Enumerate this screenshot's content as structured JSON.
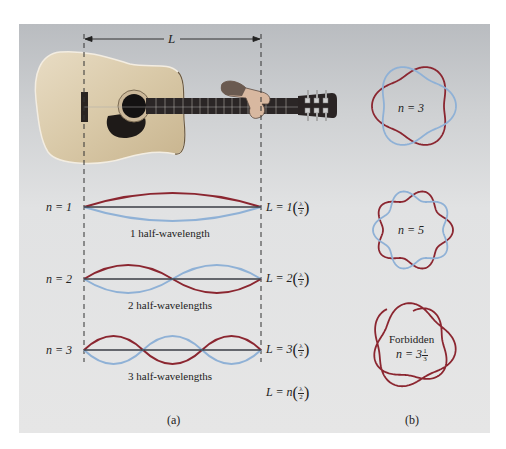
{
  "figure": {
    "dimension_label": "L",
    "panel_a_caption": "(a)",
    "panel_b_caption": "(b)",
    "colors": {
      "wave_dark": "#8b2630",
      "wave_light": "#8fb1d6",
      "string": "#3a3d45",
      "dashed": "#333333",
      "panel_bg_top": "#b9bcc0",
      "panel_bg_bottom": "#e6e6e6"
    }
  },
  "modes": [
    {
      "n_label": "n = 1",
      "n_value": 1,
      "caption": "1 half-wavelength",
      "equation_prefix": "L = 1",
      "fraction_num": "λ",
      "fraction_den": "2"
    },
    {
      "n_label": "n = 2",
      "n_value": 2,
      "caption": "2 half-wavelengths",
      "equation_prefix": "L = 2",
      "fraction_num": "λ",
      "fraction_den": "2"
    },
    {
      "n_label": "n = 3",
      "n_value": 3,
      "caption": "3 half-wavelengths",
      "equation_prefix": "L = 3",
      "fraction_num": "λ",
      "fraction_den": "2"
    }
  ],
  "general_equation": {
    "prefix": "L = n",
    "fraction_num": "λ",
    "fraction_den": "2"
  },
  "rings": [
    {
      "label": "n = 3",
      "n_value": 3,
      "allowed": true
    },
    {
      "label": "n = 5",
      "n_value": 5,
      "allowed": true
    },
    {
      "label_top": "Forbidden",
      "label": "n = 3",
      "frac_num": "1",
      "frac_den": "3",
      "n_value": 3.333,
      "allowed": false
    }
  ]
}
